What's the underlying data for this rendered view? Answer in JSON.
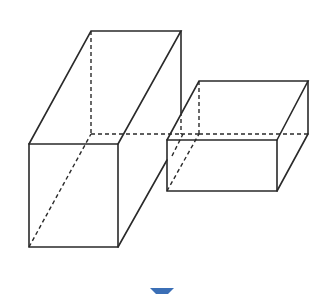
{
  "figure": {
    "big_box": {
      "front": [
        [
          29,
          144
        ],
        [
          118,
          144
        ],
        [
          118,
          247
        ],
        [
          29,
          247
        ]
      ],
      "back_top_left": [
        91,
        31
      ],
      "back_top_right": [
        181,
        31
      ],
      "hidden_back_bottom_left": [
        91,
        134
      ],
      "hidden_back_bottom_right": [
        181,
        134
      ]
    },
    "small_box": {
      "front": [
        [
          167,
          140
        ],
        [
          277,
          140
        ],
        [
          277,
          191
        ],
        [
          167,
          191
        ]
      ],
      "back_top_left": [
        199,
        81
      ],
      "back_top_right": [
        308,
        81
      ],
      "hidden_back_bottom_left": [
        199,
        134
      ],
      "back_bottom_right": [
        308,
        134
      ]
    },
    "marker": {
      "shape": "downward-triangle",
      "color": "#3b6fb6"
    }
  }
}
